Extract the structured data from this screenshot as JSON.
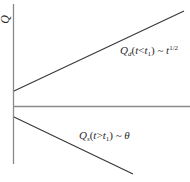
{
  "diagram": {
    "y_axis_label": "Q",
    "curves": [
      {
        "id": "Qd",
        "label": {
          "symbol": "Q",
          "subscript": "d",
          "condition_var": "t",
          "condition_op": "<",
          "condition_bound": "t",
          "condition_bound_sub": "1",
          "relation": "~",
          "scaling_base": "t",
          "scaling_exponent": "1/2"
        },
        "trend": "increasing",
        "stroke": "#3a3a3a"
      },
      {
        "id": "Qs",
        "label": {
          "symbol": "Q",
          "subscript": "s",
          "condition_var": "t",
          "condition_op": ">",
          "condition_bound": "t",
          "condition_bound_sub": "1",
          "relation": "~",
          "scaling_base": "θ"
        },
        "trend": "decreasing",
        "stroke": "#3a3a3a"
      }
    ],
    "axis_color": "#8a8a8a"
  }
}
